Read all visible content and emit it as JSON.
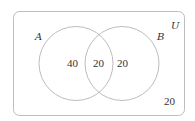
{
  "diagram": {
    "type": "venn",
    "universe_label": "U",
    "sets": [
      {
        "label": "A"
      },
      {
        "label": "B"
      }
    ],
    "regions": {
      "a_only": "40",
      "a_and_b": "20",
      "b_only": "20",
      "neither": "20"
    }
  },
  "colors": {
    "outline": "#bdbdbd",
    "text": "#333333",
    "background": "#ffffff"
  }
}
